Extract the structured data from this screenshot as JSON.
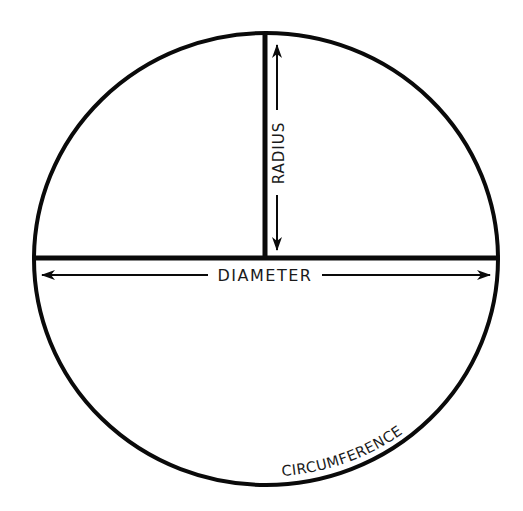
{
  "diagram": {
    "labels": {
      "radius": "RADIUS",
      "diameter": "DIAMETER",
      "circumference": "CIRCUMFERENCE"
    },
    "colors": {
      "stroke": "#0a0a0a",
      "text": "#1a1a1a",
      "background": "#ffffff"
    }
  }
}
